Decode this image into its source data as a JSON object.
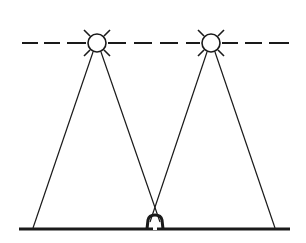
{
  "diagram": {
    "colors": {
      "line": "#1a1a1a",
      "background": "#ffffff"
    },
    "lamps": [
      {
        "name": "left-lamp",
        "cx": 97,
        "cy": 43,
        "r": 9
      },
      {
        "name": "right-lamp",
        "cx": 211,
        "cy": 43,
        "r": 9
      }
    ],
    "floor": {
      "x1": 19,
      "x2": 290,
      "y": 229
    },
    "obstacle": {
      "x": 149,
      "width": 13,
      "height": 14
    }
  }
}
